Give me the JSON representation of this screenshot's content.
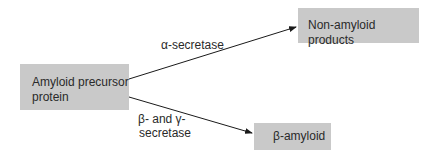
{
  "diagram": {
    "type": "flow",
    "nodes": {
      "app": {
        "label_line1": "Amyloid precursor",
        "label_line2": "protein"
      },
      "non_amyloid": {
        "label": "Non-amyloid products"
      },
      "beta_amyloid": {
        "label": "β-amyloid"
      }
    },
    "edges": {
      "alpha": {
        "from": "Amyloid precursor protein",
        "to": "Non-amyloid products",
        "label": "α-secretase"
      },
      "beta_gamma": {
        "from": "Amyloid precursor protein",
        "to": "β-amyloid",
        "label_line1": "β- and γ-",
        "label_line2": "secretase"
      }
    },
    "colors": {
      "box_fill": "#c9c9c9",
      "arrow": "#1a1a1a",
      "text": "#2a2a2a",
      "background": "#ffffff"
    }
  }
}
